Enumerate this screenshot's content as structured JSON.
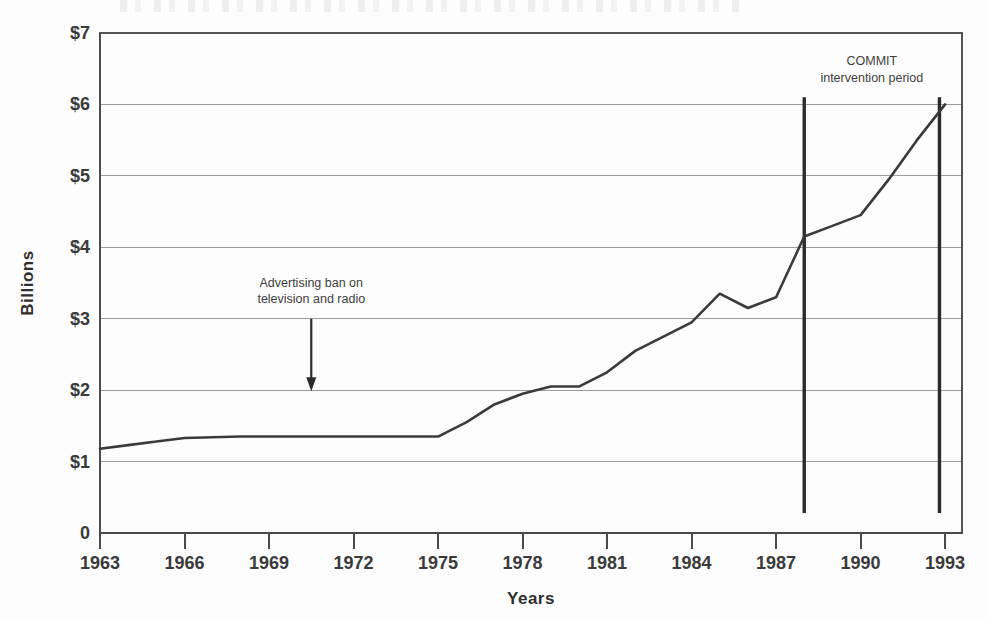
{
  "chart_data": {
    "type": "line",
    "title": "",
    "subtitle": "",
    "xlabel": "Years",
    "ylabel": "Billions",
    "xlim": [
      1963,
      1993.6
    ],
    "ylim": [
      0,
      7
    ],
    "grid": true,
    "legend": "none",
    "y_ticks": [
      0,
      1,
      2,
      3,
      4,
      5,
      6,
      7
    ],
    "y_tick_labels": [
      "0",
      "$1",
      "$2",
      "$3",
      "$4",
      "$5",
      "$6",
      "$7"
    ],
    "x_ticks": [
      1963,
      1966,
      1969,
      1972,
      1975,
      1978,
      1981,
      1984,
      1987,
      1990,
      1993
    ],
    "x_tick_labels": [
      "1963",
      "1966",
      "1969",
      "1972",
      "1975",
      "1978",
      "1981",
      "1984",
      "1987",
      "1990",
      "1993"
    ],
    "series": [
      {
        "name": "Advertising expenditures",
        "color": "#3a3a3a",
        "x": [
          1963,
          1964,
          1965,
          1966,
          1967,
          1968,
          1969,
          1970,
          1971,
          1972,
          1973,
          1974,
          1975,
          1976,
          1977,
          1978,
          1979,
          1980,
          1981,
          1982,
          1983,
          1984,
          1985,
          1986,
          1987,
          1988,
          1989,
          1990,
          1991,
          1992,
          1993
        ],
        "values": [
          1.18,
          1.23,
          1.28,
          1.33,
          1.34,
          1.35,
          1.35,
          1.35,
          1.35,
          1.35,
          1.35,
          1.35,
          1.35,
          1.55,
          1.8,
          1.95,
          2.05,
          2.05,
          2.25,
          2.55,
          2.75,
          2.95,
          3.35,
          3.15,
          3.3,
          4.15,
          4.3,
          4.45,
          4.95,
          5.5,
          6.0
        ]
      }
    ],
    "annotations": [
      {
        "id": "ad-ban",
        "label_line1": "Advertising ban on",
        "label_line2": "television and radio",
        "x": 1970.5,
        "arrow_from_y": 3.0,
        "arrow_to_y": 2.0,
        "style": "down-arrow"
      },
      {
        "id": "commit",
        "label_line1": "COMMIT",
        "label_line2": "intervention period",
        "x_start": 1988.0,
        "x_end": 1992.8,
        "marker_top_y": 6.1,
        "marker_bottom_y": 0.28,
        "style": "vertical-rules"
      }
    ],
    "colors": {
      "line": "#3a3a3a",
      "grid": "#9a9a9a",
      "frame": "#555555",
      "marker": "#2b2b2b",
      "background": "#fdfdfd",
      "text": "#3a3a3a"
    }
  }
}
